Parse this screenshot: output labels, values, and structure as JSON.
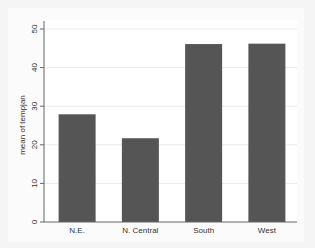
{
  "chart_data": {
    "type": "bar",
    "title": "",
    "xlabel": "",
    "ylabel": "mean of tempjan",
    "categories": [
      "N.E.",
      "N. Central",
      "South",
      "West"
    ],
    "values": [
      27.9,
      21.7,
      46.1,
      46.2
    ],
    "ylim": [
      0,
      50
    ],
    "yticks": [
      0,
      10,
      20,
      30,
      40,
      50
    ],
    "grid": true,
    "legend": null,
    "colors": {
      "bar": "#555555",
      "background_outer": "#f4f5f4",
      "background_plot": "#ffffff",
      "grid": "#eaeaea",
      "axis": "#666666"
    }
  }
}
